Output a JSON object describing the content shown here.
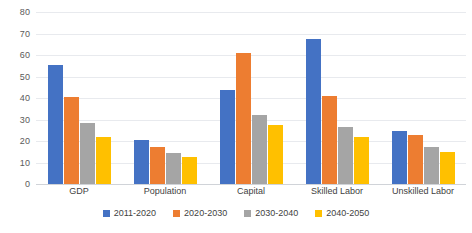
{
  "chart_data": {
    "type": "bar",
    "title": "",
    "subtitle": "",
    "xlabel": "",
    "ylabel": "",
    "ylim": [
      0,
      80
    ],
    "ytick_step": 10,
    "yticks": [
      80,
      70,
      60,
      50,
      40,
      30,
      20,
      10,
      0
    ],
    "grid": true,
    "legend_position": "bottom",
    "categories": [
      "GDP",
      "Population",
      "Capital",
      "Skilled Labor",
      "Unskilled Labor"
    ],
    "series": [
      {
        "name": "2011-2020",
        "color": "#4472C4",
        "values": [
          55.5,
          20.5,
          43.5,
          67.5,
          24.5
        ]
      },
      {
        "name": "2020-2030",
        "color": "#ED7D31",
        "values": [
          40.5,
          17.0,
          61.0,
          41.0,
          23.0
        ]
      },
      {
        "name": "2030-2040",
        "color": "#A5A5A5",
        "values": [
          28.5,
          14.5,
          32.0,
          26.5,
          17.0
        ]
      },
      {
        "name": "2040-2050",
        "color": "#FFC000",
        "values": [
          22.0,
          12.5,
          27.5,
          22.0,
          15.0
        ]
      }
    ]
  },
  "colors": {
    "series_1": "#4472C4",
    "series_2": "#ED7D31",
    "series_3": "#A5A5A5",
    "series_4": "#FFC000",
    "gridline": "#E8EAEE",
    "axis_text": "#5A5A5A",
    "label_text": "#3F3F3F",
    "background": "#FFFFFF"
  }
}
